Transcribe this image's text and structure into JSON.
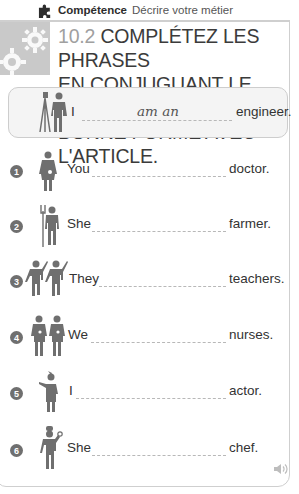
{
  "header": {
    "icon": "puzzle-icon",
    "label_bold": "Compétence",
    "label": "Décrire votre métier"
  },
  "exercise": {
    "icon": "gears-icon",
    "number": "10.2",
    "title_lines": [
      "COMPLÉTEZ LES PHRASES",
      "EN CONJUGUANT LE VERBE À LA",
      "BONNE FORME AVEC L'ARTICLE."
    ]
  },
  "example": {
    "figure": "engineer-figure-icon",
    "pronoun": "I",
    "answer": "am an",
    "ending": "engineer."
  },
  "items": [
    {
      "number": "1",
      "figure": "doctor-figure-icon",
      "pronoun": "You",
      "answer": "",
      "ending": "doctor."
    },
    {
      "number": "2",
      "figure": "farmer-figure-icon",
      "pronoun": "She",
      "answer": "",
      "ending": "farmer."
    },
    {
      "number": "3",
      "figure": "teachers-figure-icon",
      "pronoun": "They",
      "answer": "",
      "ending": "teachers."
    },
    {
      "number": "4",
      "figure": "nurses-figure-icon",
      "pronoun": "We",
      "answer": "",
      "ending": "nurses."
    },
    {
      "number": "5",
      "figure": "actor-figure-icon",
      "pronoun": "I",
      "answer": "",
      "ending": "actor."
    },
    {
      "number": "6",
      "figure": "chef-figure-icon",
      "pronoun": "She",
      "answer": "",
      "ending": "chef."
    }
  ],
  "audio": {
    "icon": "speaker-icon"
  },
  "colors": {
    "icon_gray": "#6f6f6f",
    "tab_gray": "#c9c9c9",
    "border_gray": "#cfcfcf",
    "title_text": "#3b3b3b",
    "number_text": "#a0a0a0"
  }
}
